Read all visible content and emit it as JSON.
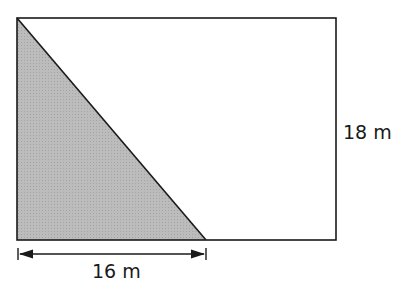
{
  "diagram": {
    "shape": "rectangle with shaded right triangle",
    "labels": {
      "height": "18 m",
      "base": "16 m"
    },
    "colors": {
      "stroke": "#1a1a1a",
      "shade": "#b4b4b4",
      "background": "#ffffff"
    }
  }
}
